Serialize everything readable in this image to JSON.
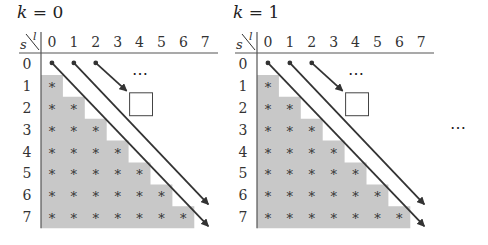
{
  "panels": [
    {
      "title_var": "k",
      "title_eq": " = ",
      "title_val": "0",
      "corner_row": "s",
      "corner_col": "l",
      "columns": [
        "0",
        "1",
        "2",
        "3",
        "4",
        "5",
        "6",
        "7"
      ],
      "rows": [
        "0",
        "1",
        "2",
        "3",
        "4",
        "5",
        "6",
        "7"
      ],
      "ellipsis": "⋯"
    },
    {
      "title_var": "k",
      "title_eq": " = ",
      "title_val": "1",
      "corner_row": "s",
      "corner_col": "l",
      "columns": [
        "0",
        "1",
        "2",
        "3",
        "4",
        "5",
        "6",
        "7"
      ],
      "rows": [
        "0",
        "1",
        "2",
        "3",
        "4",
        "5",
        "6",
        "7"
      ],
      "ellipsis": "⋯"
    }
  ],
  "trailing_ellipsis": "⋯",
  "cell_marker": "*",
  "colors": {
    "shade": "#c8c8c8",
    "line": "#333333",
    "text": "#333333"
  }
}
